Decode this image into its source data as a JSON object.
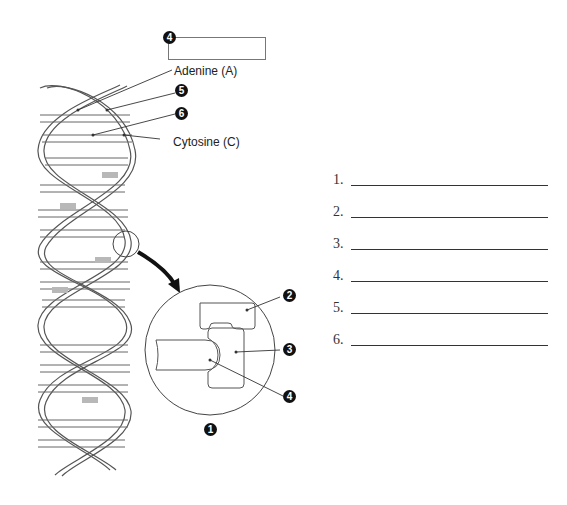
{
  "diagram": {
    "title_box_badge": "4",
    "labels": {
      "adenine": "Adenine (A)",
      "cytosine": "Cytosine (C)"
    },
    "badges_helix": [
      "5",
      "6"
    ],
    "badges_zoom": [
      "2",
      "3",
      "4",
      "1"
    ]
  },
  "answers": {
    "items": [
      {
        "num": "1.",
        "value": ""
      },
      {
        "num": "2.",
        "value": ""
      },
      {
        "num": "3.",
        "value": ""
      },
      {
        "num": "4.",
        "value": ""
      },
      {
        "num": "5.",
        "value": ""
      },
      {
        "num": "6.",
        "value": ""
      }
    ]
  },
  "colors": {
    "ink": "#333333",
    "shade": "#b8b8b8",
    "badge": "#111111"
  }
}
